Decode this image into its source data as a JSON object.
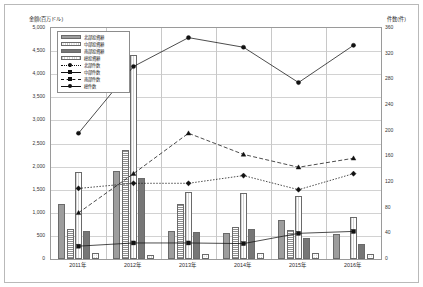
{
  "axes": {
    "left_title": "金額(百万ドル)",
    "right_title": "件数(件)",
    "left_ticks": [
      "5,000",
      "4,500",
      "4,000",
      "3,500",
      "3,000",
      "2,500",
      "2,000",
      "1,500",
      "1,000",
      "500",
      "0"
    ],
    "right_ticks": [
      "360",
      "320",
      "280",
      "240",
      "200",
      "160",
      "120",
      "80",
      "40",
      "0"
    ]
  },
  "legend": {
    "items": [
      {
        "label": "北部投資額",
        "kind": "bar",
        "pattern": "p-north"
      },
      {
        "label": "中部投資額",
        "kind": "bar",
        "pattern": "p-central"
      },
      {
        "label": "南部投資額",
        "kind": "bar",
        "pattern": "p-south"
      },
      {
        "label": "総投資額",
        "kind": "bar",
        "pattern": "p-total"
      },
      {
        "label": "北部件数",
        "kind": "line",
        "marker": "diamond"
      },
      {
        "label": "中部件数",
        "kind": "line",
        "marker": "square"
      },
      {
        "label": "南部件数",
        "kind": "line",
        "marker": "triangle"
      },
      {
        "label": "総件数",
        "kind": "line",
        "marker": "circle"
      }
    ]
  },
  "chart_data": {
    "type": "bar",
    "title": "",
    "xlabel": "",
    "ylabel": "金額(百万ドル)",
    "y2label": "件数(件)",
    "ylim": [
      0,
      5000
    ],
    "y2lim": [
      0,
      360
    ],
    "grid": true,
    "legend_position": "top-left",
    "categories": [
      "2011年",
      "2012年",
      "2013年",
      "2014年",
      "2015年",
      "2016年"
    ],
    "bar_series": [
      {
        "name": "北部投資額",
        "pattern": "p-north",
        "values": [
          1200,
          1900,
          600,
          560,
          840,
          540
        ]
      },
      {
        "name": "中部投資額",
        "pattern": "p-central",
        "values": [
          120,
          80,
          100,
          130,
          120,
          100
        ]
      },
      {
        "name": "南部投資額",
        "pattern": "p-south",
        "values": [
          600,
          1760,
          590,
          640,
          460,
          330
        ]
      },
      {
        "name": "総投資額",
        "pattern": "p-total",
        "values": [
          1880,
          4420,
          1450,
          1420,
          1360,
          900
        ]
      }
    ],
    "hstripe_series": [
      {
        "name": "南部投資額(補助)",
        "pattern": "p-hstripe",
        "values": [
          640,
          2350,
          1200,
          700,
          620,
          0
        ]
      }
    ],
    "line_series": [
      {
        "name": "北部件数",
        "marker": "diamond",
        "style": "dotted",
        "values": [
          110,
          118,
          118,
          130,
          108,
          133
        ]
      },
      {
        "name": "中部件数",
        "marker": "square",
        "style": "solid",
        "values": [
          20,
          25,
          25,
          24,
          40,
          43
        ]
      },
      {
        "name": "南部件数",
        "marker": "triangle",
        "style": "dashed",
        "values": [
          72,
          133,
          196,
          163,
          143,
          157
        ]
      },
      {
        "name": "総件数",
        "marker": "circle",
        "style": "solid",
        "values": [
          196,
          300,
          345,
          330,
          275,
          333
        ]
      }
    ]
  }
}
